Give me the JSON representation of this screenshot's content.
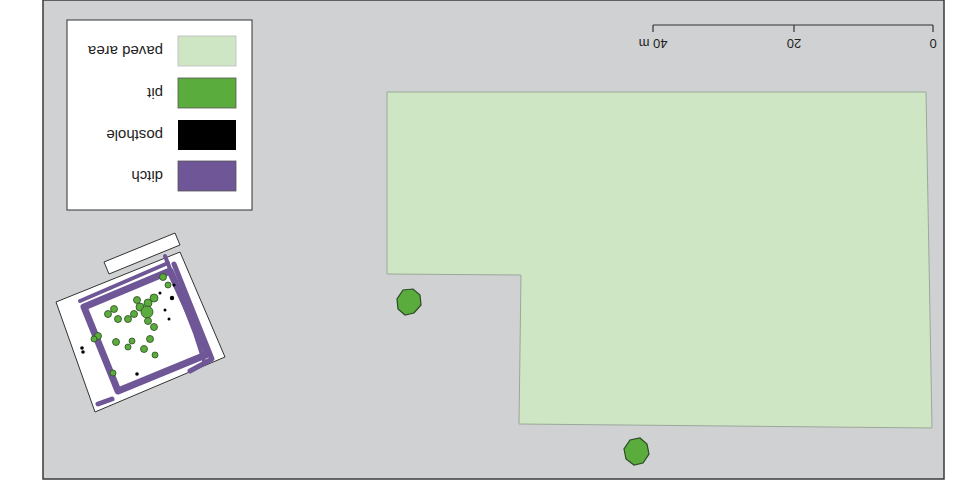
{
  "orientation": "rotated-180",
  "colors": {
    "background": "#cfd1d3",
    "frame": "#3a3a3a",
    "paved_area": "#cfe6c4",
    "paved_stroke": "#9aa89a",
    "pit": "#5aad3c",
    "pit_stroke": "#2d4a25",
    "posthole": "#000000",
    "ditch": "#6e5697",
    "excavation": "#ffffff"
  },
  "legend": {
    "items": [
      {
        "label": "paved area",
        "color": "#cfe6c4"
      },
      {
        "label": "pit",
        "color": "#5aad3c"
      },
      {
        "label": "posthole",
        "color": "#000000"
      },
      {
        "label": "ditch",
        "color": "#6e5697"
      }
    ]
  },
  "scale_bar": {
    "ticks": [
      "0",
      "20",
      "40 m"
    ]
  }
}
